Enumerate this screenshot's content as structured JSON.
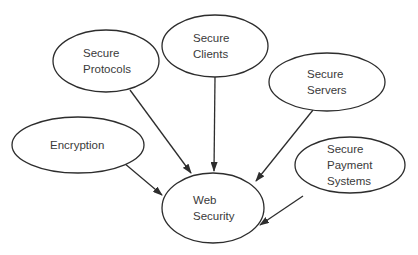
{
  "diagram": {
    "type": "node-link",
    "background": "#ffffff",
    "stroke_color": "#2d2d2d",
    "text_color": "#3a3a3a",
    "center_node": "web-security",
    "nodes": [
      {
        "id": "secure-protocols",
        "label": "Secure\nProtocols",
        "cx": 106,
        "cy": 61,
        "rx": 53,
        "ry": 31,
        "tx": 83
      },
      {
        "id": "secure-clients",
        "label": "Secure\nClients",
        "cx": 215,
        "cy": 46,
        "rx": 53,
        "ry": 31,
        "tx": 193
      },
      {
        "id": "secure-servers",
        "label": "Secure\nServers",
        "cx": 327,
        "cy": 82,
        "rx": 58,
        "ry": 29,
        "tx": 307
      },
      {
        "id": "encryption",
        "label": "Encryption",
        "cx": 78,
        "cy": 145,
        "rx": 66,
        "ry": 28,
        "tx": 50
      },
      {
        "id": "secure-payment-systems",
        "label": "Secure\nPayment\nSystems",
        "cx": 350,
        "cy": 165,
        "rx": 55,
        "ry": 28,
        "tx": 327
      },
      {
        "id": "web-security",
        "label": "Web\nSecurity",
        "cx": 213,
        "cy": 208,
        "rx": 51,
        "ry": 35,
        "tx": 193
      }
    ],
    "edges": [
      {
        "from": "secure-protocols",
        "to": "web-security",
        "x1": 130,
        "y1": 90,
        "x2": 191,
        "y2": 173
      },
      {
        "from": "secure-clients",
        "to": "web-security",
        "x1": 215,
        "y1": 77,
        "x2": 214,
        "y2": 171
      },
      {
        "from": "secure-servers",
        "to": "web-security",
        "x1": 313,
        "y1": 110,
        "x2": 256,
        "y2": 181
      },
      {
        "from": "encryption",
        "to": "web-security",
        "x1": 124,
        "y1": 163,
        "x2": 162,
        "y2": 195
      },
      {
        "from": "secure-payment-systems",
        "to": "web-security",
        "x1": 303,
        "y1": 196,
        "x2": 260,
        "y2": 225
      }
    ],
    "arrowhead": {
      "length": 10,
      "width": 7
    },
    "line_height": 16,
    "baseline_offset": 4
  }
}
